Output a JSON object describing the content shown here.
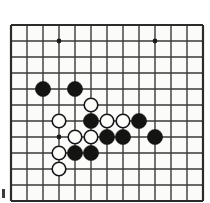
{
  "figure": {
    "kind": "go-board-diagram",
    "background_color": "#fbfbf9",
    "paper_color": "#ffffff"
  },
  "board": {
    "line_color": "#3a3a38",
    "border_color": "#2b2b29",
    "grid_spacing": 16,
    "origin_x": 11,
    "origin_y": 25,
    "columns": 12,
    "rows": 11,
    "line_width": 1.4,
    "border_width": 2.2,
    "star_point_color": "#1a1a18",
    "star_point_radius": 2.4,
    "star_points": [
      {
        "x": 59,
        "y": 41
      },
      {
        "x": 155,
        "y": 41
      },
      {
        "x": 59,
        "y": 137
      }
    ]
  },
  "stones": {
    "radius": 7.6,
    "black_fill": "#141412",
    "black_stroke": "#141412",
    "white_fill": "#fcfcfa",
    "white_stroke": "#16161a",
    "white_stroke_width": 1.6,
    "items": [
      {
        "color": "black",
        "x": 43,
        "y": 89
      },
      {
        "color": "black",
        "x": 75,
        "y": 89
      },
      {
        "color": "white",
        "x": 91,
        "y": 105
      },
      {
        "color": "white",
        "x": 59,
        "y": 121
      },
      {
        "color": "black",
        "x": 91,
        "y": 121
      },
      {
        "color": "white",
        "x": 107,
        "y": 121
      },
      {
        "color": "white",
        "x": 123,
        "y": 121
      },
      {
        "color": "black",
        "x": 139,
        "y": 121
      },
      {
        "color": "white",
        "x": 75,
        "y": 137
      },
      {
        "color": "white",
        "x": 91,
        "y": 137
      },
      {
        "color": "black",
        "x": 107,
        "y": 137
      },
      {
        "color": "black",
        "x": 123,
        "y": 137
      },
      {
        "color": "black",
        "x": 155,
        "y": 137
      },
      {
        "color": "white",
        "x": 59,
        "y": 153
      },
      {
        "color": "black",
        "x": 75,
        "y": 153
      },
      {
        "color": "black",
        "x": 91,
        "y": 153
      },
      {
        "color": "white",
        "x": 59,
        "y": 169
      }
    ]
  },
  "artifacts": [
    {
      "name": "scan-mark-bottom-left",
      "x": 2,
      "y": 189,
      "width": 3,
      "height": 9,
      "color": "#3b3b3b"
    }
  ]
}
